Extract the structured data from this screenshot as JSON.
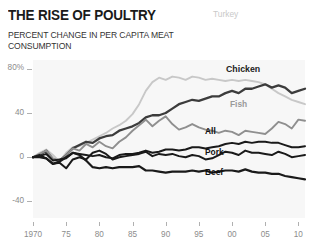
{
  "header": {
    "title": "THE RISE OF POULTRY",
    "subtitle": "PERCENT CHANGE IN PER CAPITA MEAT CONSUMPTION"
  },
  "labels": {
    "turkey": "Turkey",
    "chicken": "Chicken",
    "fish": "Fish",
    "all": "All",
    "pork": "Pork",
    "beef": "Beef"
  },
  "axis": {
    "y_ticks": [
      "80%",
      "40",
      "0",
      "-40"
    ],
    "x_ticks": [
      "1970",
      "75",
      "80",
      "85",
      "90",
      "95",
      "00",
      "05",
      "10"
    ]
  },
  "chart_data": {
    "type": "line",
    "title": "THE RISE OF POULTRY",
    "subtitle": "PERCENT CHANGE IN PER CAPITA MEAT CONSUMPTION",
    "xlabel": "",
    "ylabel": "Percent change",
    "xlim": [
      1970,
      2011
    ],
    "ylim": [
      -55,
      88
    ],
    "ytick_values": [
      80,
      40,
      0,
      -40
    ],
    "ytick_labels": [
      "80%",
      "40",
      "0",
      "-40"
    ],
    "xtick_values": [
      1970,
      1975,
      1980,
      1985,
      1990,
      1995,
      2000,
      2005,
      2010
    ],
    "xtick_labels": [
      "1970",
      "75",
      "80",
      "85",
      "90",
      "95",
      "00",
      "05",
      "10"
    ],
    "grid": false,
    "legend": "inline-labels",
    "plot_background": "#f7f7f7",
    "x": [
      1970,
      1971,
      1972,
      1973,
      1974,
      1975,
      1976,
      1977,
      1978,
      1979,
      1980,
      1981,
      1982,
      1983,
      1984,
      1985,
      1986,
      1987,
      1988,
      1989,
      1990,
      1991,
      1992,
      1993,
      1994,
      1995,
      1996,
      1997,
      1998,
      1999,
      2000,
      2001,
      2002,
      2003,
      2004,
      2005,
      2006,
      2007,
      2008,
      2009,
      2010,
      2011
    ],
    "series": [
      {
        "name": "Turkey",
        "color": "#c8c8c8",
        "width": 1.9,
        "values": [
          0,
          4,
          7,
          2,
          -4,
          4,
          9,
          10,
          13,
          16,
          19,
          22,
          26,
          29,
          33,
          39,
          48,
          60,
          68,
          72,
          70,
          73,
          72,
          70,
          73,
          72,
          70,
          71,
          70,
          69,
          70,
          69,
          70,
          69,
          68,
          66,
          62,
          58,
          55,
          52,
          50,
          48
        ]
      },
      {
        "name": "Chicken",
        "color": "#3c3c3c",
        "width": 2.3,
        "values": [
          0,
          2,
          6,
          -2,
          -3,
          2,
          8,
          11,
          14,
          13,
          17,
          19,
          20,
          24,
          26,
          28,
          31,
          36,
          38,
          38,
          40,
          44,
          48,
          50,
          52,
          51,
          53,
          55,
          55,
          58,
          60,
          58,
          62,
          62,
          64,
          66,
          63,
          65,
          63,
          58,
          60,
          62
        ]
      },
      {
        "name": "Fish",
        "color": "#8f8f8f",
        "width": 1.9,
        "values": [
          0,
          3,
          6,
          -1,
          -4,
          2,
          8,
          6,
          12,
          9,
          14,
          10,
          8,
          14,
          18,
          24,
          29,
          34,
          28,
          33,
          37,
          30,
          25,
          27,
          30,
          27,
          25,
          24,
          22,
          24,
          23,
          20,
          24,
          23,
          22,
          21,
          26,
          32,
          30,
          26,
          34,
          33
        ]
      },
      {
        "name": "All",
        "color": "#1a1a1a",
        "width": 2.0,
        "values": [
          0,
          1,
          3,
          -3,
          -2,
          -1,
          4,
          3,
          2,
          1,
          2,
          0,
          -1,
          2,
          3,
          3,
          4,
          6,
          4,
          5,
          7,
          7,
          6,
          7,
          9,
          9,
          8,
          9,
          10,
          12,
          13,
          12,
          14,
          13,
          14,
          14,
          13,
          13,
          11,
          9,
          9,
          10
        ]
      },
      {
        "name": "Pork",
        "color": "#1a1a1a",
        "width": 2.0,
        "values": [
          0,
          2,
          -1,
          -6,
          -5,
          -10,
          -2,
          0,
          -2,
          4,
          6,
          3,
          -2,
          0,
          1,
          2,
          3,
          5,
          1,
          3,
          2,
          3,
          1,
          0,
          2,
          1,
          -2,
          -1,
          2,
          5,
          4,
          2,
          6,
          4,
          4,
          3,
          2,
          5,
          3,
          0,
          1,
          2
        ]
      },
      {
        "name": "Beef",
        "color": "#1a1a1a",
        "width": 2.2,
        "values": [
          0,
          0,
          -1,
          -6,
          -4,
          0,
          4,
          2,
          -3,
          -9,
          -10,
          -9,
          -10,
          -9,
          -9,
          -9,
          -8,
          -12,
          -12,
          -13,
          -14,
          -13,
          -13,
          -13,
          -12,
          -13,
          -12,
          -14,
          -13,
          -12,
          -12,
          -13,
          -11,
          -13,
          -14,
          -14,
          -15,
          -15,
          -17,
          -18,
          -19,
          -20
        ]
      }
    ]
  }
}
